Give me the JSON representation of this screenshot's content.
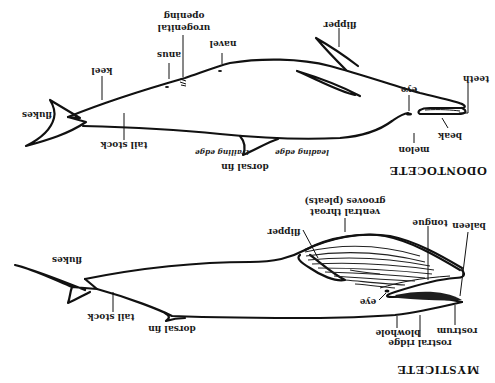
{
  "orientation": "rotated-180",
  "odontocete": {
    "title": "ODONTOCETE",
    "labels": {
      "urogenital_line1": "urogenital",
      "urogenital_line2": "opening",
      "navel": "navel",
      "anus": "anus",
      "keel": "keel",
      "flukes": "flukes",
      "tail_stock": "tail stock",
      "trailing_edge": "trailing edge",
      "dorsal_fin": "dorsal fin",
      "leading_edge": "leading edge",
      "flipper": "flipper",
      "eye": "eye",
      "teeth": "teeth",
      "beak": "beak",
      "melon": "melon"
    }
  },
  "mysticete": {
    "title": "MYSTICETE",
    "labels": {
      "flukes": "flukes",
      "tail_stock": "tail stock",
      "dorsal_fin": "dorsal fin",
      "ventral_line1": "ventral throat",
      "ventral_line2": "grooves (pleats)",
      "flipper": "flipper",
      "tongue": "tongue",
      "baleen": "baleen",
      "eye": "eye",
      "blowhole": "blowhole",
      "rostral_ridge": "rostral ridge",
      "rostrum": "rostrum"
    }
  }
}
